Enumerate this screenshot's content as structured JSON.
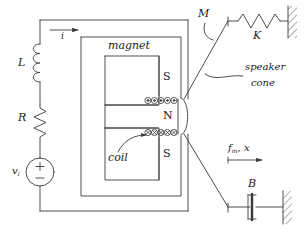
{
  "figure": {
    "stroke_color": "#3a3a3a",
    "text_color": "#1a1a1a",
    "background": "#ffffff"
  },
  "circuit": {
    "current_label": "i",
    "inductor_label": "L",
    "resistor_label": "R",
    "source_label_base": "v",
    "source_label_sub": "i",
    "source_plus": "+",
    "source_minus": "−"
  },
  "magnet": {
    "body_label": "magnet",
    "pole_top": "S",
    "pole_middle": "N",
    "pole_bottom": "S",
    "coil_label": "coil",
    "winding_glyph": "⊗",
    "winding_count_top": 5,
    "winding_count_bottom": 5
  },
  "mechanics": {
    "mass_label": "M",
    "spring_label": "K",
    "damper_label": "B",
    "cone_label_line1": "speaker",
    "cone_label_line2": "cone",
    "force_label_base": "f",
    "force_label_sub": "m",
    "force_label_tail": ", x"
  }
}
